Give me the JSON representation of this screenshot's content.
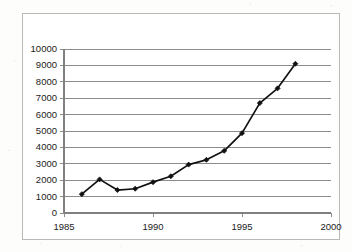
{
  "chart_data": {
    "type": "line",
    "title": "",
    "subtitle": "",
    "xlabel": "",
    "ylabel": "",
    "xlim": [
      1985,
      2000
    ],
    "ylim": [
      0,
      10000
    ],
    "xticks": [
      1985,
      1990,
      1995,
      2000
    ],
    "xtick_labels": [
      "1985",
      "1990",
      "1995",
      "2000"
    ],
    "yticks": [
      0,
      1000,
      2000,
      3000,
      4000,
      5000,
      6000,
      7000,
      8000,
      9000,
      10000
    ],
    "ytick_labels": [
      "0",
      "1000",
      "2000",
      "3000",
      "4000",
      "5000",
      "6000",
      "7000",
      "8000",
      "9000",
      "10000"
    ],
    "grid": "horizontal",
    "legend": "none",
    "marker": "diamond",
    "line_color": "#111111",
    "marker_color": "#111111",
    "grid_color": "#808080",
    "axis_color": "#808080",
    "x": [
      1986,
      1987,
      1988,
      1989,
      1990,
      1991,
      1992,
      1993,
      1994,
      1995,
      1996,
      1997,
      1998
    ],
    "values": [
      1150,
      2050,
      1400,
      1480,
      1880,
      2240,
      2950,
      3240,
      3790,
      4870,
      6700,
      7600,
      9100
    ],
    "series": [
      {
        "name": "series-1",
        "values": [
          1150,
          2050,
          1400,
          1480,
          1880,
          2240,
          2950,
          3240,
          3790,
          4870,
          6700,
          7600,
          9100
        ]
      }
    ]
  },
  "frame": {
    "border_color": "#b9b9b9",
    "background": "#ffffff"
  }
}
